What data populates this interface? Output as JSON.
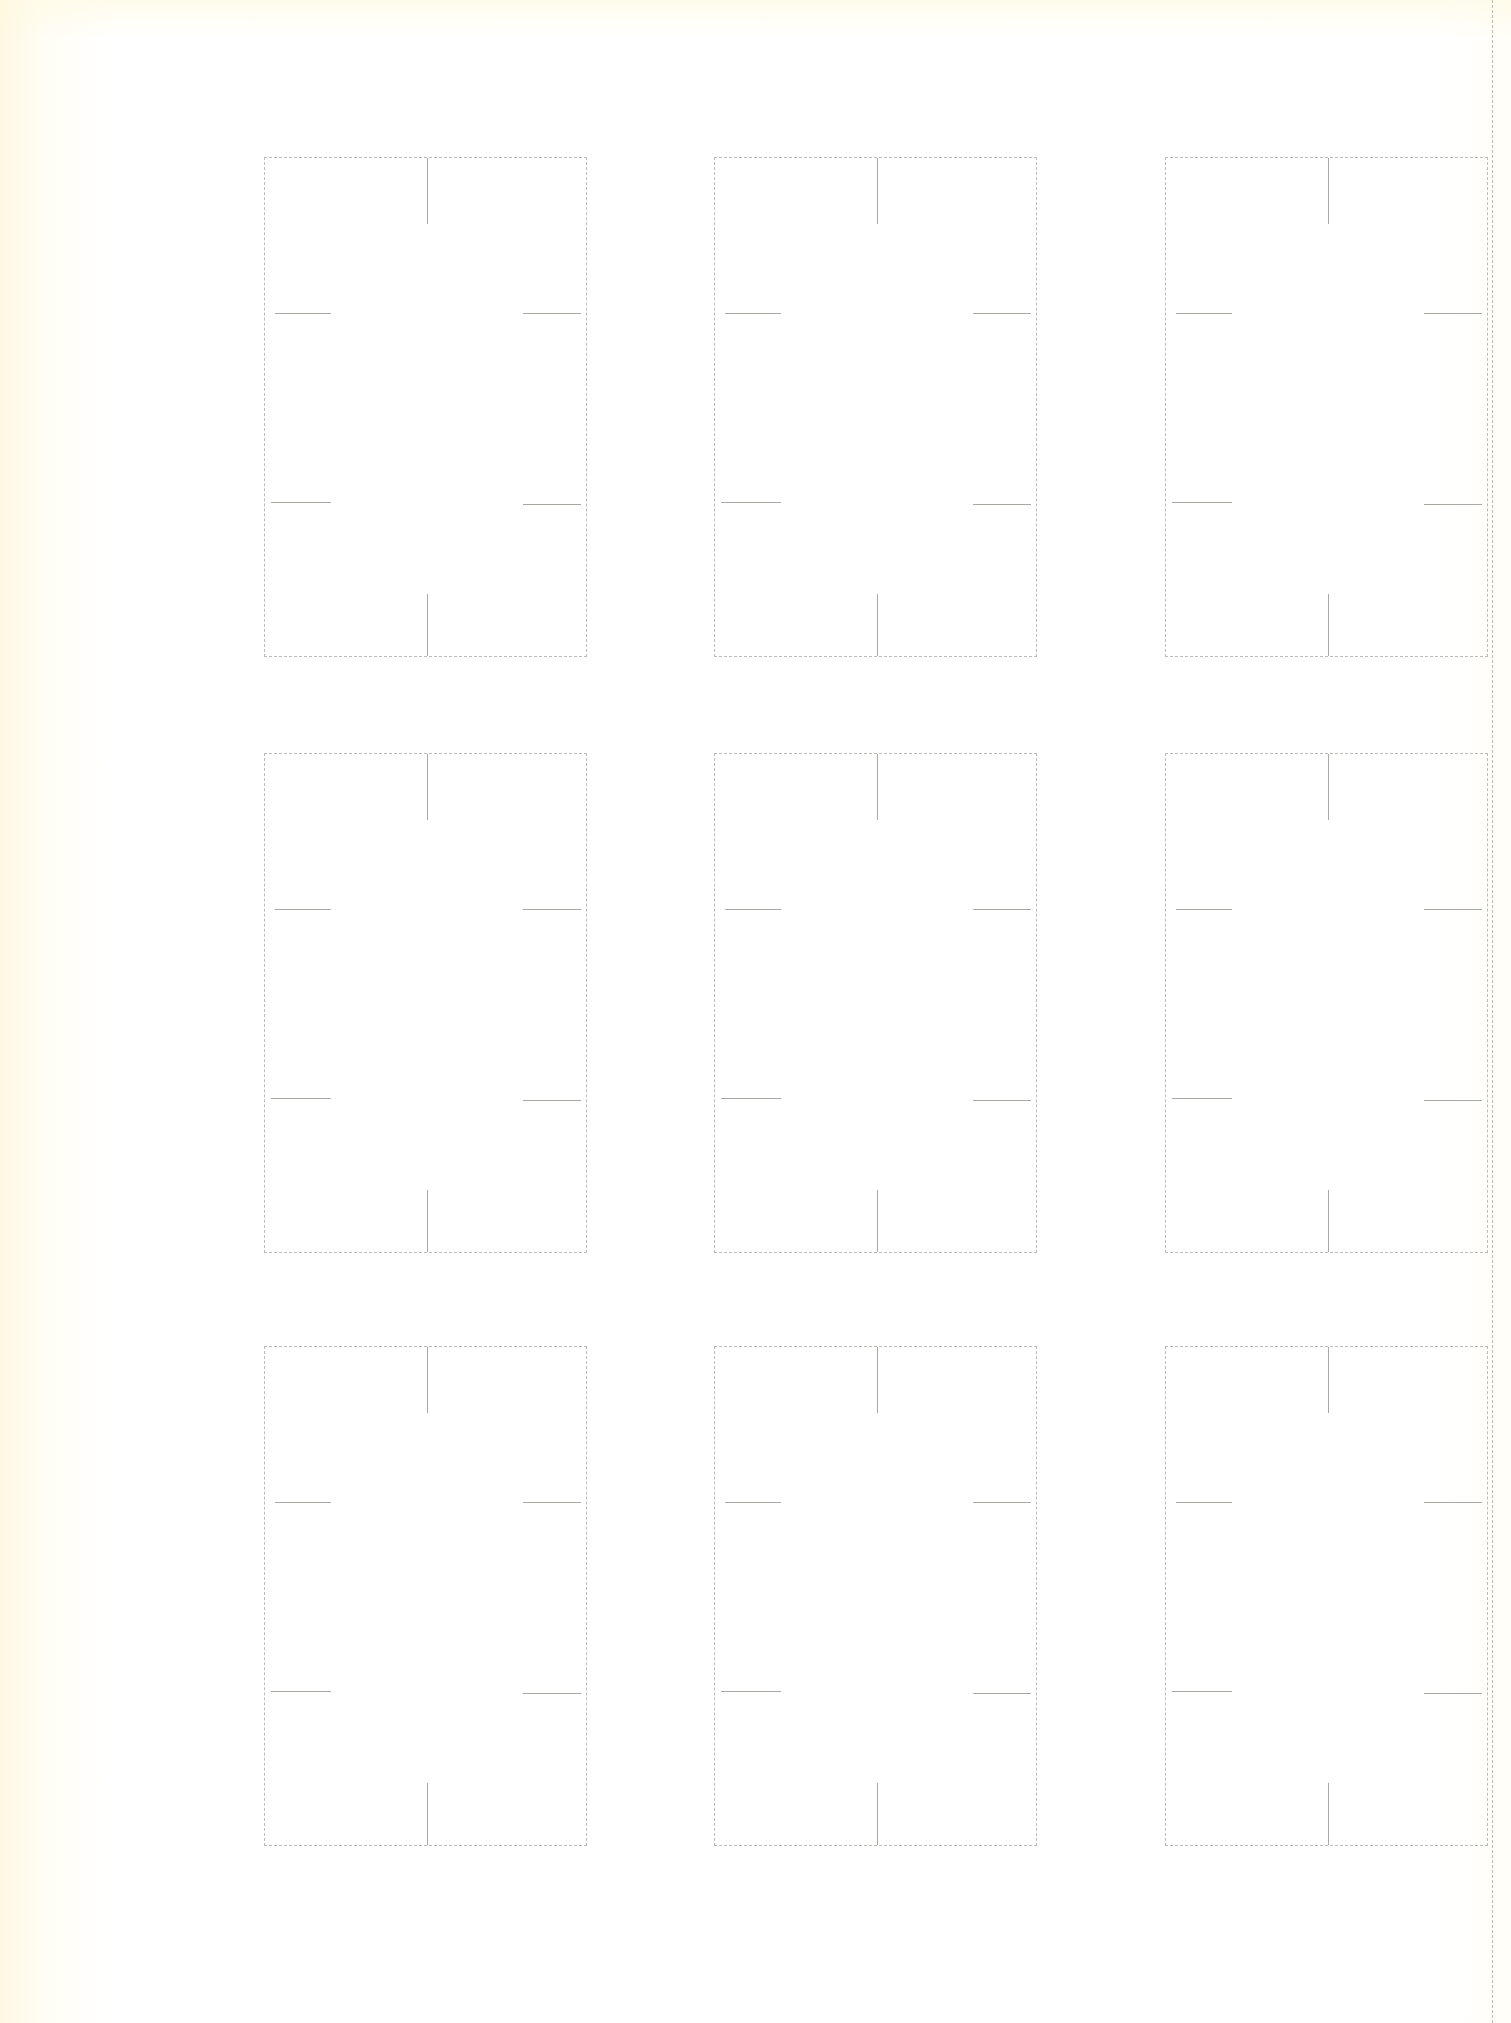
{
  "document": {
    "type": "scanned template sheet",
    "background_color": "#ffffff",
    "paper_tint_color": "#fdf8e2",
    "outline_color": "#bdbdb8",
    "tick_color": "#a9a9a4",
    "grid": {
      "rows": 3,
      "columns": 3
    },
    "trim_line": {
      "x": 1492
    },
    "card_size": {
      "width": 323,
      "height": 500
    },
    "column_x": [
      264,
      714,
      1165
    ],
    "row_y": [
      157,
      753,
      1346
    ],
    "cards": [
      {
        "row": 1,
        "col": 1
      },
      {
        "row": 1,
        "col": 2
      },
      {
        "row": 1,
        "col": 3
      },
      {
        "row": 2,
        "col": 1
      },
      {
        "row": 2,
        "col": 2
      },
      {
        "row": 2,
        "col": 3
      },
      {
        "row": 3,
        "col": 1
      },
      {
        "row": 3,
        "col": 2
      },
      {
        "row": 3,
        "col": 3
      }
    ],
    "tick_marks": {
      "center_top": {
        "offset_x": 162,
        "y_from": 0,
        "length": 66
      },
      "center_bottom": {
        "offset_x": 162,
        "y_from": 436,
        "length": 62
      },
      "left_upper": {
        "offset_y": 155,
        "x_from": 10,
        "length": 56
      },
      "left_lower": {
        "offset_y": 344,
        "x_from": 6,
        "length": 60
      },
      "right_upper": {
        "offset_y": 155,
        "x_from": 258,
        "length": 58
      },
      "right_lower": {
        "offset_y": 346,
        "x_from": 258,
        "length": 58
      }
    }
  }
}
